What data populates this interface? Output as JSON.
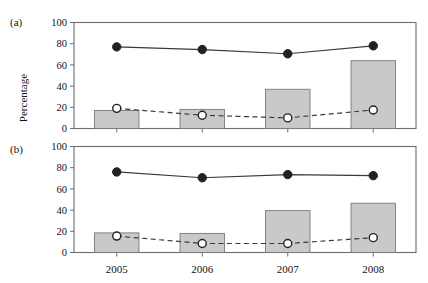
{
  "figure": {
    "ylabel": "Percentage",
    "panel_a_tag": "(a)",
    "panel_b_tag": "(b)"
  },
  "chart_data": [
    {
      "type": "bar",
      "panel": "(a)",
      "title": "",
      "xlabel": "",
      "ylabel": "Percentage",
      "categories": [
        "2005",
        "2006",
        "2007",
        "2008"
      ],
      "ylim": [
        0,
        100
      ],
      "yticks": [
        0,
        20,
        40,
        60,
        80,
        100
      ],
      "grid": false,
      "legend": "none",
      "series": [
        {
          "name": "bars",
          "style": "bar",
          "fill": "#c9c9c9",
          "values": [
            17,
            18,
            37,
            64
          ]
        },
        {
          "name": "solid-line-filled-circle",
          "style": "line-solid",
          "marker": "filled-circle",
          "values": [
            77,
            74.5,
            70.5,
            78
          ]
        },
        {
          "name": "dashed-line-open-circle",
          "style": "line-dashed",
          "marker": "open-circle",
          "values": [
            19,
            12.5,
            10,
            17.5
          ]
        }
      ]
    },
    {
      "type": "bar",
      "panel": "(b)",
      "title": "",
      "xlabel": "",
      "ylabel": "Percentage",
      "categories": [
        "2005",
        "2006",
        "2007",
        "2008"
      ],
      "ylim": [
        0,
        100
      ],
      "yticks": [
        0,
        20,
        40,
        60,
        80,
        100
      ],
      "grid": false,
      "legend": "none",
      "series": [
        {
          "name": "bars",
          "style": "bar",
          "fill": "#c9c9c9",
          "values": [
            18.5,
            18,
            39.5,
            46.5
          ]
        },
        {
          "name": "solid-line-filled-circle",
          "style": "line-solid",
          "marker": "filled-circle",
          "values": [
            76,
            70.5,
            73.5,
            72.5
          ]
        },
        {
          "name": "dashed-line-open-circle",
          "style": "line-dashed",
          "marker": "open-circle",
          "values": [
            15.5,
            8.5,
            8.5,
            14
          ]
        }
      ]
    }
  ],
  "colors": {
    "bar_fill": "#c9c9c9",
    "bar_stroke": "#7a7a7a",
    "line": "#3a3a3a",
    "axis": "#6d6d6d",
    "text": "#111111",
    "background": "#ffffff"
  }
}
